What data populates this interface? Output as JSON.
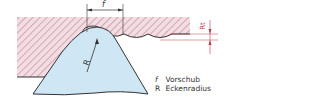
{
  "diagram": {
    "labels": {
      "feed_symbol": "f",
      "radius_symbol": "R",
      "roughness_symbol": "Rt"
    },
    "legend": [
      {
        "symbol": "f",
        "text": "Vorschub"
      },
      {
        "symbol": "R",
        "text": "Eckenradius"
      }
    ],
    "colors": {
      "workpiece_fill": "#f3dde2",
      "hatch": "#b07080",
      "tool_fill": "#cfe6f5",
      "outline": "#333333",
      "dimension": "#c0394a"
    }
  }
}
